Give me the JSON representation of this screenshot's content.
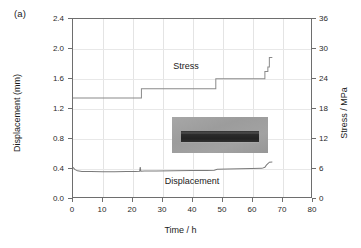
{
  "panel": {
    "label": "(a)"
  },
  "chart_data": {
    "type": "line",
    "title": "",
    "xlabel": "Time / h",
    "ylabel": "Displacement (mm)",
    "y2label": "Stress / MPa",
    "xlim": [
      0,
      80
    ],
    "ylim": [
      0.0,
      2.4
    ],
    "y2lim": [
      0,
      36
    ],
    "xticks": [
      "0",
      "10",
      "20",
      "30",
      "40",
      "50",
      "60",
      "70",
      "80"
    ],
    "xtick_values": [
      0,
      10,
      20,
      30,
      40,
      50,
      60,
      70,
      80
    ],
    "yticks": [
      "0.0",
      "0.4",
      "0.8",
      "1.2",
      "1.6",
      "2.0",
      "2.4"
    ],
    "ytick_values": [
      0.0,
      0.4,
      0.8,
      1.2,
      1.6,
      2.0,
      2.4
    ],
    "y2ticks": [
      "0",
      "6",
      "12",
      "18",
      "24",
      "30",
      "36"
    ],
    "y2tick_values": [
      0,
      6,
      12,
      18,
      24,
      30,
      36
    ],
    "grid": true,
    "legend": "inline-annotations",
    "annotations": [
      {
        "text": "Stress",
        "x": 38,
        "y_axis": "right",
        "y": 26.5
      },
      {
        "text": "Displacement",
        "x": 40,
        "y_axis": "left",
        "y": 0.23
      }
    ],
    "series": [
      {
        "name": "Stress",
        "axis": "right",
        "unit": "MPa",
        "style": "step",
        "color": "#8a8a8a",
        "points": [
          [
            0.0,
            20.0
          ],
          [
            23.0,
            20.0
          ],
          [
            23.0,
            21.9
          ],
          [
            48.0,
            21.9
          ],
          [
            48.0,
            23.9
          ],
          [
            64.5,
            23.9
          ],
          [
            64.5,
            25.4
          ],
          [
            65.5,
            25.4
          ],
          [
            65.5,
            26.3
          ],
          [
            66.0,
            26.3
          ],
          [
            66.0,
            28.2
          ],
          [
            67.0,
            28.2
          ]
        ]
      },
      {
        "name": "Displacement",
        "axis": "left",
        "unit": "mm",
        "style": "line",
        "color": "#7a7a7a",
        "points": [
          [
            0.0,
            0.4
          ],
          [
            0.6,
            0.372
          ],
          [
            1.5,
            0.353
          ],
          [
            3.0,
            0.345
          ],
          [
            6.0,
            0.343
          ],
          [
            10.0,
            0.342
          ],
          [
            14.0,
            0.342
          ],
          [
            18.0,
            0.343
          ],
          [
            21.0,
            0.344
          ],
          [
            22.4,
            0.347
          ],
          [
            22.6,
            0.405
          ],
          [
            22.8,
            0.348
          ],
          [
            24.0,
            0.35
          ],
          [
            28.0,
            0.352
          ],
          [
            34.0,
            0.354
          ],
          [
            40.0,
            0.356
          ],
          [
            45.0,
            0.358
          ],
          [
            47.5,
            0.36
          ],
          [
            48.5,
            0.375
          ],
          [
            52.0,
            0.378
          ],
          [
            56.0,
            0.381
          ],
          [
            60.0,
            0.383
          ],
          [
            63.5,
            0.386
          ],
          [
            64.5,
            0.4
          ],
          [
            65.0,
            0.43
          ],
          [
            65.6,
            0.452
          ],
          [
            66.0,
            0.47
          ],
          [
            67.0,
            0.472
          ]
        ]
      }
    ]
  },
  "inset": {
    "name": "specimen-photograph",
    "description": "grayscale photo of dark rectangular specimen bar on gray background"
  },
  "colors": {
    "axis": "#6e6e6e",
    "grid": "#e4e4e4",
    "stress_curve": "#8a8a8a",
    "displacement_curve": "#7a7a7a",
    "text": "#1a1a1a",
    "background": "#ffffff"
  }
}
